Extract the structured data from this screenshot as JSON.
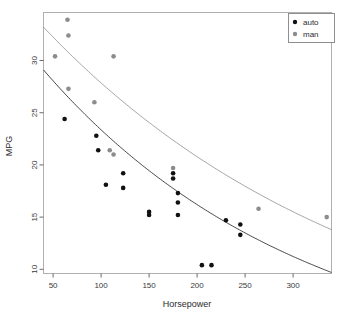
{
  "chart_data": {
    "type": "scatter",
    "title": "",
    "xlabel": "Horsepower",
    "ylabel": "MPG",
    "xlim": [
      40,
      340
    ],
    "ylim": [
      9.6,
      34.6
    ],
    "xticks": [
      50,
      100,
      150,
      200,
      250,
      300
    ],
    "yticks": [
      10,
      15,
      20,
      25,
      30
    ],
    "grid": false,
    "legend_position": "top-right",
    "series": [
      {
        "name": "auto",
        "color": "#111111",
        "marker": "filled-circle",
        "points": [
          {
            "x": 62,
            "y": 24.4
          },
          {
            "x": 95,
            "y": 22.8
          },
          {
            "x": 97,
            "y": 21.4
          },
          {
            "x": 105,
            "y": 18.1
          },
          {
            "x": 123,
            "y": 19.2
          },
          {
            "x": 123,
            "y": 17.8
          },
          {
            "x": 150,
            "y": 15.5
          },
          {
            "x": 150,
            "y": 15.2
          },
          {
            "x": 175,
            "y": 19.2
          },
          {
            "x": 175,
            "y": 18.7
          },
          {
            "x": 180,
            "y": 17.3
          },
          {
            "x": 180,
            "y": 16.4
          },
          {
            "x": 180,
            "y": 15.2
          },
          {
            "x": 205,
            "y": 10.4
          },
          {
            "x": 215,
            "y": 10.4
          },
          {
            "x": 230,
            "y": 14.7
          },
          {
            "x": 245,
            "y": 14.3
          },
          {
            "x": 245,
            "y": 13.3
          }
        ],
        "trend": {
          "type": "exponential-decay",
          "x_start": 40,
          "y_start": 29.1,
          "x_end": 340,
          "y_end": 9.7,
          "color": "#333333"
        }
      },
      {
        "name": "man",
        "color": "#8c8c8c",
        "marker": "filled-circle",
        "points": [
          {
            "x": 52,
            "y": 30.4
          },
          {
            "x": 65,
            "y": 33.9
          },
          {
            "x": 66,
            "y": 32.4
          },
          {
            "x": 66,
            "y": 27.3
          },
          {
            "x": 93,
            "y": 26.0
          },
          {
            "x": 109,
            "y": 21.4
          },
          {
            "x": 113,
            "y": 21.0
          },
          {
            "x": 113,
            "y": 30.4
          },
          {
            "x": 175,
            "y": 19.7
          },
          {
            "x": 264,
            "y": 15.8
          },
          {
            "x": 335,
            "y": 15.0
          }
        ],
        "trend": {
          "type": "exponential-decay",
          "x_start": 40,
          "y_start": 33.2,
          "x_end": 340,
          "y_end": 13.8,
          "color": "#9a9a9a"
        }
      }
    ],
    "legend": [
      {
        "label": "auto",
        "color": "#111111"
      },
      {
        "label": "man",
        "color": "#8c8c8c"
      }
    ]
  },
  "axes": {
    "x_label": "Horsepower",
    "y_label": "MPG",
    "x_tick_labels": [
      "50",
      "100",
      "150",
      "200",
      "250",
      "300"
    ],
    "y_tick_labels": [
      "10",
      "15",
      "20",
      "25",
      "30"
    ]
  },
  "colors": {
    "auto_point": "#111111",
    "man_point": "#8c8c8c",
    "auto_curve": "#333333",
    "man_curve": "#9a9a9a",
    "frame": "#b0b0b0",
    "axis": "#6b6b6b",
    "background": "#ffffff"
  }
}
